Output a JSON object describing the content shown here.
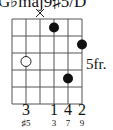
{
  "chord": {
    "name": "G♭maj9♯5/D",
    "position_label": "5fr.",
    "muted_strings": [
      3
    ],
    "open_marker_string": 2,
    "dots": [
      {
        "string": 4,
        "fret": 1,
        "filled": true
      },
      {
        "string": 6,
        "fret": 2,
        "filled": true
      },
      {
        "string": 2,
        "fret": 3,
        "filled": false
      },
      {
        "string": 5,
        "fret": 4,
        "filled": true
      }
    ],
    "fingers": [
      {
        "string": 2,
        "label": "3"
      },
      {
        "string": 4,
        "label": "1"
      },
      {
        "string": 5,
        "label": "4"
      },
      {
        "string": 6,
        "label": "2"
      }
    ],
    "intervals": [
      {
        "string": 2,
        "label": "♯5"
      },
      {
        "string": 4,
        "label": "3"
      },
      {
        "string": 5,
        "label": "7"
      },
      {
        "string": 6,
        "label": "9"
      }
    ],
    "mute_symbol": "×"
  }
}
